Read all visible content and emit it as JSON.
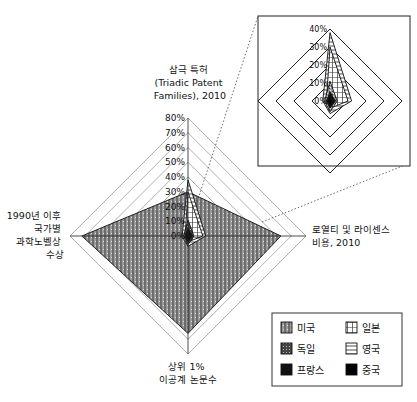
{
  "chart_data": {
    "type": "radar",
    "title": "",
    "axes": [
      {
        "key": "triadic",
        "label_lines": [
          "삼극 특허",
          "(Triadic Patent",
          "Families), 2010"
        ]
      },
      {
        "key": "royalty",
        "label_lines": [
          "로열티 및 라이센스",
          "비용, 2010"
        ]
      },
      {
        "key": "papers",
        "label_lines": [
          "상위 1%",
          "이공계 논문수"
        ]
      },
      {
        "key": "nobel",
        "label_lines": [
          "1990년 이후",
          "국가별",
          "과학노벨상",
          "수상"
        ]
      }
    ],
    "rmax": 80,
    "ticks": [
      "0%",
      "10%",
      "20%",
      "30%",
      "40%",
      "50%",
      "60%",
      "70%",
      "80%"
    ],
    "tick_values": [
      0,
      10,
      20,
      30,
      40,
      50,
      60,
      70,
      80
    ],
    "series": [
      {
        "name": "미국",
        "pattern": "us",
        "values": {
          "triadic": 30,
          "royalty": 63,
          "papers": 66,
          "nobel": 72
        }
      },
      {
        "name": "일본",
        "pattern": "jp",
        "values": {
          "triadic": 30,
          "royalty": 10,
          "papers": 4,
          "nobel": 2
        }
      },
      {
        "name": "영국",
        "pattern": "uk",
        "values": {
          "triadic": 38,
          "royalty": 12,
          "papers": 7,
          "nobel": 4
        }
      },
      {
        "name": "독일",
        "pattern": "de",
        "values": {
          "triadic": 11,
          "royalty": 4,
          "papers": 6,
          "nobel": 3
        }
      },
      {
        "name": "프랑스",
        "pattern": "fr",
        "values": {
          "triadic": 5,
          "royalty": 3,
          "papers": 4,
          "nobel": 2
        }
      },
      {
        "name": "중국",
        "pattern": "cn",
        "values": {
          "triadic": 1,
          "royalty": 1,
          "papers": 3,
          "nobel": 1
        }
      }
    ],
    "inset": {
      "rmax": 40,
      "ticks": [
        "0%",
        "10%",
        "20%",
        "30%",
        "40%"
      ],
      "tick_values": [
        0,
        10,
        20,
        30,
        40
      ],
      "series_shown": [
        "일본",
        "영국",
        "독일",
        "프랑스",
        "중국"
      ]
    },
    "legend": {
      "position": "bottom-right",
      "entries": [
        "미국",
        "일본",
        "독일",
        "영국",
        "프랑스",
        "중국"
      ]
    },
    "grid": true
  }
}
